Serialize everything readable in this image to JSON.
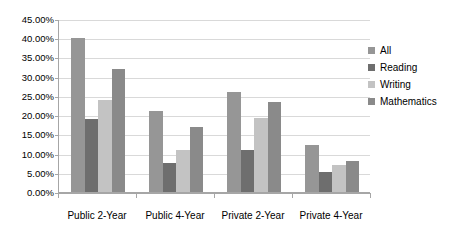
{
  "chart_data": {
    "type": "bar",
    "title": "",
    "xlabel": "",
    "ylabel": "",
    "categories": [
      "Public 2-Year",
      "Public 4-Year",
      "Private 2-Year",
      "Private 4-Year"
    ],
    "series": [
      {
        "name": "All",
        "color": "#969696",
        "values": [
          40.0,
          21.0,
          26.0,
          12.3
        ]
      },
      {
        "name": "Reading",
        "color": "#6e6e6e",
        "values": [
          19.0,
          7.5,
          11.0,
          5.3
        ]
      },
      {
        "name": "Writing",
        "color": "#c3c3c3",
        "values": [
          24.0,
          11.0,
          19.2,
          7.0
        ]
      },
      {
        "name": "Mathematics",
        "color": "#8a8a8a",
        "values": [
          32.0,
          17.0,
          23.5,
          8.0
        ]
      }
    ],
    "ylim": [
      0,
      45
    ],
    "ytick_step": 5,
    "ytick_labels": [
      "0.00%",
      "5.00%",
      "10.00%",
      "15.00%",
      "20.00%",
      "25.00%",
      "30.00%",
      "35.00%",
      "40.00%",
      "45.00%"
    ],
    "ytick_values": [
      0,
      5,
      10,
      15,
      20,
      25,
      30,
      35,
      40,
      45
    ],
    "grid": true,
    "grid_axis": "y",
    "legend_position": "right",
    "value_format": "percent"
  },
  "colors": {
    "background": "#ffffff",
    "axis": "#a6a6a6",
    "gridline": "#d9d9d9",
    "text": "#000000"
  }
}
